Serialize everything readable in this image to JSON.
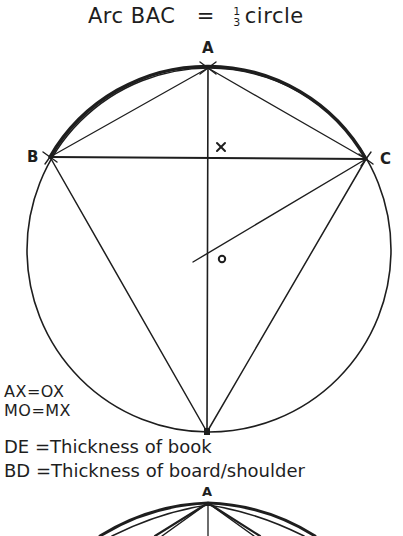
{
  "title": {
    "left": "Arc BAC",
    "equals": "=",
    "frac_num": "1",
    "frac_den": "3",
    "right": "circle"
  },
  "points": {
    "A": "A",
    "B": "B",
    "C": "C",
    "X": "x",
    "O": "o",
    "A2": "A"
  },
  "equations": {
    "eq1": "AX=OX",
    "eq2": "MO=MX"
  },
  "definitions": {
    "de": "DE =Thickness of book",
    "bd": "BD =Thickness of board/shoulder"
  },
  "colors": {
    "ink": "#1e1e1e",
    "background": "#ffffff"
  }
}
